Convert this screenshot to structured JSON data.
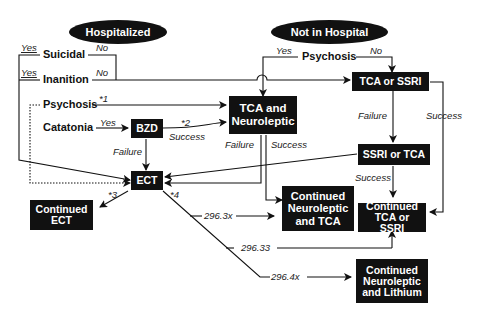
{
  "headers": {
    "hospitalized": "Hospitalized",
    "not_in_hospital": "Not in Hospital"
  },
  "conditions": {
    "suicidal": "Suicidal",
    "inanition": "Inanition",
    "psychosis_hosp": "Psychosis",
    "catatonia": "Catatonia",
    "psychosis_out": "Psychosis"
  },
  "boxes": {
    "bzd": "BZD",
    "ect": "ECT",
    "tca_neuroleptic": "TCA and\nNeuroleptic",
    "tca_or_ssri": "TCA or SSRI",
    "ssri_or_tca": "SSRI or TCA",
    "continued_ect": "Continued\nECT",
    "continued_neuroleptic_tca": "Continued\nNeuroleptic\nand TCA",
    "continued_tca_ssri": "Continued\nTCA or SSRI",
    "continued_neuroleptic_lithium": "Continued\nNeuroleptic\nand Lithium"
  },
  "edge_labels": {
    "suicidal_yes": "Yes",
    "suicidal_no": "No",
    "inanition_yes": "Yes",
    "inanition_no": "No",
    "psychosis_note": "*1",
    "catatonia_yes": "Yes",
    "bzd_note": "*2",
    "bzd_success": "Success",
    "bzd_failure": "Failure",
    "tcan_failure": "Failure",
    "tcan_success": "Success",
    "out_psych_yes": "Yes",
    "out_psych_no": "No",
    "tcassri_failure": "Failure",
    "tcassri_success": "Success",
    "ssritca_success": "Success",
    "ect_note3": "*3",
    "ect_note4": "*4",
    "code_1": "296.3x",
    "code_2": "296.33",
    "code_3": "296.4x"
  }
}
